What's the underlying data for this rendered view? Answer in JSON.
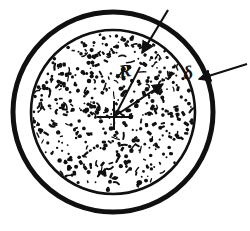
{
  "figure": {
    "background_color": "#ffffff",
    "ink_color": "#101010",
    "width": 250,
    "height": 231
  },
  "geometry": {
    "center": {
      "x": 113,
      "y": 112
    },
    "outer_circle": {
      "radius": 100,
      "stroke_width": 5,
      "label": "outer-circle"
    },
    "inner_circle": {
      "radius": 82,
      "stroke_width": 2.6,
      "label": "inner-speckled-circle"
    },
    "annulus_thickness_px": 18
  },
  "labels": {
    "radius": {
      "text": "R",
      "name": "radius-label",
      "x": 119,
      "y": 62
    },
    "thickness": {
      "text": "δ",
      "name": "thickness-label",
      "x": 183,
      "y": 63
    }
  },
  "annotations": {
    "leader_to_inner_boundary": {
      "name": "leader-line-outer-top",
      "from": {
        "x": 168,
        "y": 10
      },
      "to": {
        "x": 141,
        "y": 56
      },
      "arrow_at": "to"
    },
    "arrow_to_annulus": {
      "name": "arrow-to-annulus",
      "from": {
        "x": 247,
        "y": 64
      },
      "to": {
        "x": 196,
        "y": 80
      },
      "arrow_at": "to"
    },
    "radius_arrow": {
      "name": "radius-arrow",
      "from": {
        "x": 115,
        "y": 116
      },
      "to": {
        "x": 166,
        "y": 82
      },
      "arrow_at": "to"
    },
    "radius_line_secondary": {
      "name": "radius-line-secondary",
      "from": {
        "x": 115,
        "y": 116
      },
      "to": {
        "x": 140,
        "y": 67
      }
    },
    "center_cross": {
      "name": "center-crosshair",
      "horizontal": {
        "x1": 97,
        "y1": 117,
        "x2": 133,
        "y2": 117
      },
      "vertical": {
        "x1": 114,
        "y1": 101,
        "x2": 114,
        "y2": 130
      }
    }
  },
  "texture": {
    "name": "speckle-fill",
    "description": "irregular black flecks on white",
    "fleck_color": "#101010",
    "dot_count": 520
  }
}
